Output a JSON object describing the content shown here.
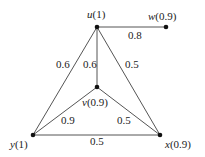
{
  "diagram": {
    "type": "weighted-graph",
    "nodes": [
      {
        "id": "u",
        "name": "u",
        "weight": "(1)",
        "x": 97,
        "y": 27,
        "lx": 87,
        "ly": 18
      },
      {
        "id": "w",
        "name": "w",
        "weight": "(0.9)",
        "x": 166,
        "y": 27,
        "lx": 148,
        "ly": 20
      },
      {
        "id": "v",
        "name": "v",
        "weight": "(0.9)",
        "x": 97,
        "y": 87,
        "lx": 82,
        "ly": 106
      },
      {
        "id": "y",
        "name": "y",
        "weight": "(1)",
        "x": 33,
        "y": 135,
        "lx": 10,
        "ly": 148
      },
      {
        "id": "x",
        "name": "x",
        "weight": "(0.9)",
        "x": 160,
        "y": 135,
        "lx": 165,
        "ly": 148
      }
    ],
    "edges": [
      {
        "from": "u",
        "to": "w",
        "label": "0.8",
        "lx": 128,
        "ly": 39
      },
      {
        "from": "u",
        "to": "y",
        "label": "0.6",
        "lx": 56,
        "ly": 68
      },
      {
        "from": "u",
        "to": "v",
        "label": "0.6",
        "lx": 83,
        "ly": 68
      },
      {
        "from": "u",
        "to": "x",
        "label": "0.5",
        "lx": 125,
        "ly": 68
      },
      {
        "from": "v",
        "to": "y",
        "label": "0.9",
        "lx": 61,
        "ly": 124
      },
      {
        "from": "v",
        "to": "x",
        "label": "0.5",
        "lx": 117,
        "ly": 124
      },
      {
        "from": "y",
        "to": "x",
        "label": "0.5",
        "lx": 90,
        "ly": 145
      }
    ]
  }
}
